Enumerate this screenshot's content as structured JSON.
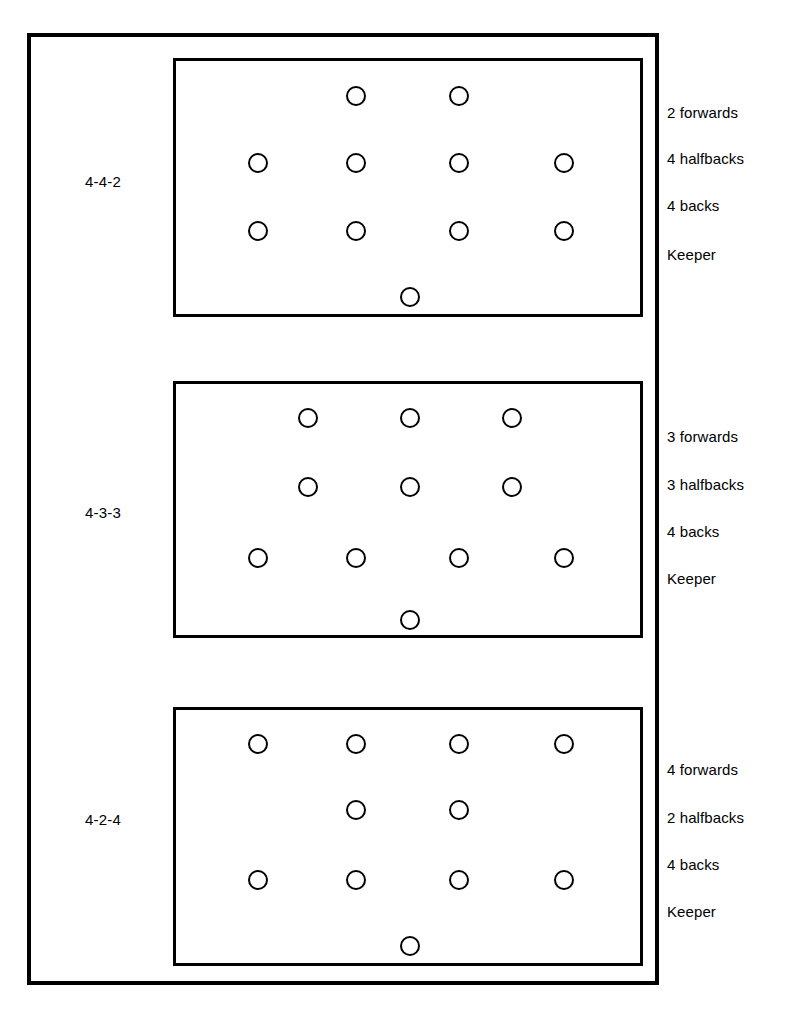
{
  "diagram": {
    "line_color": "#000000",
    "background_color": "#ffffff"
  },
  "formations": [
    {
      "name": "4-4-2",
      "pitch": {
        "x": 173,
        "y": 58,
        "w": 470,
        "h": 259
      },
      "role_labels": [
        {
          "text": "2 forwards",
          "x": 667,
          "y": 104
        },
        {
          "text": "4 halfbacks",
          "x": 667,
          "y": 150
        },
        {
          "text": "4 backs",
          "x": 667,
          "y": 197
        },
        {
          "text": "Keeper",
          "x": 667,
          "y": 246
        }
      ],
      "label_position": {
        "x": 85,
        "y": 173
      },
      "rows": [
        {
          "role": "forwards",
          "count": 2,
          "y": 96,
          "x": [
            356,
            459
          ]
        },
        {
          "role": "halfbacks",
          "count": 4,
          "y": 163,
          "x": [
            258,
            356,
            459,
            564
          ]
        },
        {
          "role": "backs",
          "count": 4,
          "y": 231,
          "x": [
            258,
            356,
            459,
            564
          ]
        },
        {
          "role": "keeper",
          "count": 1,
          "y": 297,
          "x": [
            410
          ]
        }
      ]
    },
    {
      "name": "4-3-3",
      "pitch": {
        "x": 173,
        "y": 381,
        "w": 470,
        "h": 257
      },
      "role_labels": [
        {
          "text": "3 forwards",
          "x": 667,
          "y": 428
        },
        {
          "text": "3 halfbacks",
          "x": 667,
          "y": 476
        },
        {
          "text": "4 backs",
          "x": 667,
          "y": 523
        },
        {
          "text": "Keeper",
          "x": 667,
          "y": 570
        }
      ],
      "label_position": {
        "x": 85,
        "y": 504
      },
      "rows": [
        {
          "role": "forwards",
          "count": 3,
          "y": 418,
          "x": [
            308,
            410,
            512
          ]
        },
        {
          "role": "halfbacks",
          "count": 3,
          "y": 487,
          "x": [
            308,
            410,
            512
          ]
        },
        {
          "role": "backs",
          "count": 4,
          "y": 558,
          "x": [
            258,
            356,
            459,
            564
          ]
        },
        {
          "role": "keeper",
          "count": 1,
          "y": 620,
          "x": [
            410
          ]
        }
      ]
    },
    {
      "name": "4-2-4",
      "pitch": {
        "x": 173,
        "y": 707,
        "w": 470,
        "h": 259
      },
      "role_labels": [
        {
          "text": "4 forwards",
          "x": 667,
          "y": 761
        },
        {
          "text": "2 halfbacks",
          "x": 667,
          "y": 809
        },
        {
          "text": "4 backs",
          "x": 667,
          "y": 856
        },
        {
          "text": "Keeper",
          "x": 667,
          "y": 903
        }
      ],
      "label_position": {
        "x": 85,
        "y": 811
      },
      "rows": [
        {
          "role": "forwards",
          "count": 4,
          "y": 744,
          "x": [
            258,
            356,
            459,
            564
          ]
        },
        {
          "role": "halfbacks",
          "count": 2,
          "y": 810,
          "x": [
            356,
            459
          ]
        },
        {
          "role": "backs",
          "count": 4,
          "y": 880,
          "x": [
            258,
            356,
            459,
            564
          ]
        },
        {
          "role": "keeper",
          "count": 1,
          "y": 946,
          "x": [
            410
          ]
        }
      ]
    }
  ]
}
